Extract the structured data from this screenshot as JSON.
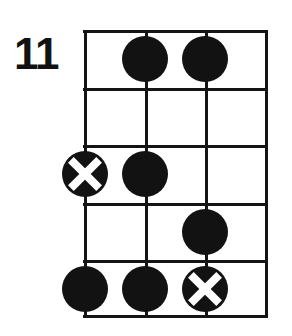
{
  "diagram": {
    "type": "guitar-chord-diagram",
    "fret_position_label": "11",
    "strings_count": 4,
    "frets_count": 5,
    "colors": {
      "ink": "#141414",
      "background": "#ffffff",
      "marker_fill": "#121212",
      "marker_cross": "#ffffff"
    },
    "geometry": {
      "grid_left": 84,
      "grid_top": 30,
      "grid_width": 182,
      "grid_height": 288,
      "string_x": [
        85,
        145,
        205,
        265
      ],
      "fret_y": [
        30,
        88,
        145,
        203,
        260,
        318
      ],
      "marker_diameter": 46,
      "line_thickness": 3
    },
    "string_lines": [
      {
        "name": "string-line-1",
        "x": 0
      },
      {
        "name": "string-line-2",
        "x": 60.7
      },
      {
        "name": "string-line-3",
        "x": 121.3
      },
      {
        "name": "string-line-4",
        "x": 182
      }
    ],
    "fret_lines": [
      {
        "name": "fret-line-0",
        "y": 0
      },
      {
        "name": "fret-line-1",
        "y": 57.6
      },
      {
        "name": "fret-line-2",
        "y": 115.2
      },
      {
        "name": "fret-line-3",
        "y": 172.8
      },
      {
        "name": "fret-line-4",
        "y": 230.4
      },
      {
        "name": "fret-line-5",
        "y": 288
      }
    ],
    "markers": [
      {
        "name": "marker-fret1-string2",
        "string": 2,
        "fret": 1,
        "style": "filled",
        "x": 61,
        "y": 29
      },
      {
        "name": "marker-fret1-string3",
        "string": 3,
        "fret": 1,
        "style": "filled",
        "x": 121,
        "y": 29
      },
      {
        "name": "marker-fret3-string1",
        "string": 1,
        "fret": 3,
        "style": "muted",
        "x": 1,
        "y": 144
      },
      {
        "name": "marker-fret3-string2",
        "string": 2,
        "fret": 3,
        "style": "filled",
        "x": 61,
        "y": 144
      },
      {
        "name": "marker-fret4-string3",
        "string": 3,
        "fret": 4,
        "style": "filled",
        "x": 121,
        "y": 202
      },
      {
        "name": "marker-fret5-string1",
        "string": 1,
        "fret": 5,
        "style": "filled",
        "x": 1,
        "y": 259
      },
      {
        "name": "marker-fret5-string2",
        "string": 2,
        "fret": 5,
        "style": "filled",
        "x": 61,
        "y": 259
      },
      {
        "name": "marker-fret5-string3",
        "string": 3,
        "fret": 5,
        "style": "muted",
        "x": 121,
        "y": 259
      }
    ]
  }
}
